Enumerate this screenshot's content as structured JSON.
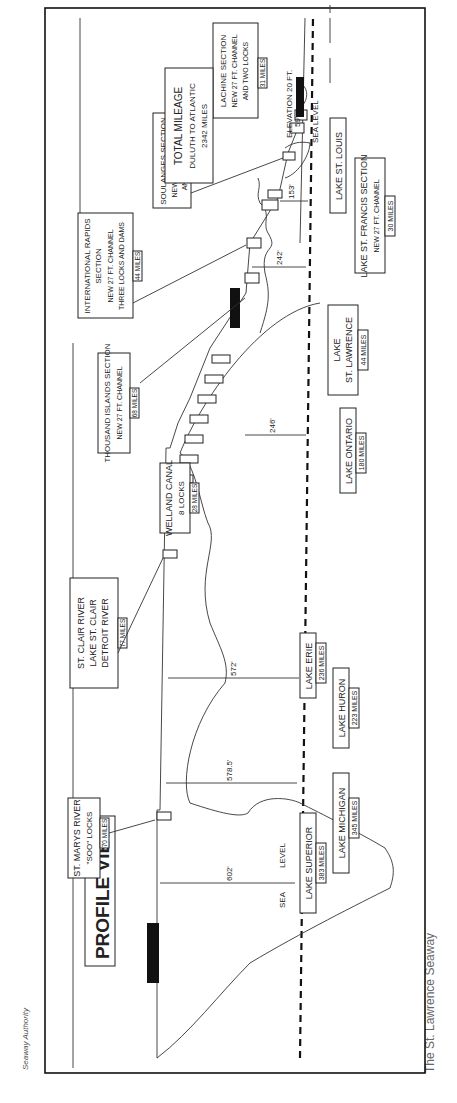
{
  "credit": "Seaway Authority",
  "caption": "The St. Lawrence Seaway",
  "title": "PROFILE VIEW",
  "sea_level_label_left": [
    "SEA",
    "LEVEL"
  ],
  "sea_level_label_right": "SEA LEVEL",
  "elevation_label": "ELEVATION 20 FT.",
  "total": {
    "line1": "TOTAL MILEAGE",
    "line2": "DULUTH TO ATLANTIC",
    "line3": "2342 MILES"
  },
  "heights": {
    "superior": "602'",
    "michigan_huron": "578.5'",
    "erie": "572'",
    "ontario": "246'",
    "st_lawrence": "242'",
    "st_francis": "153'",
    "st_louis": "59'"
  },
  "upper_labels": [
    {
      "line1": "ST. MARYS RIVER",
      "line2": "\"SOO\" LOCKS",
      "miles": "70 MILES"
    },
    {
      "line1": "ST. CLAIR RIVER",
      "line2": "LAKE ST. CLAIR",
      "line3": "DETROIT RIVER",
      "miles": "77 MILES"
    },
    {
      "line1": "WELLAND CANAL",
      "line2": "8 LOCKS",
      "miles": "28 MILES"
    },
    {
      "line1": "THOUSAND ISLANDS SECTION",
      "line2": "NEW 27 FT. CHANNEL",
      "miles": "68 MILES"
    },
    {
      "line1": "INTERNATIONAL RAPIDS",
      "line2": "SECTION",
      "line3": "NEW 27 FT. CHANNEL",
      "line4": "THREE LOCKS AND DAMS",
      "miles": "44 MILES"
    },
    {
      "line1": "SOULANGES SECTION",
      "line2": "NEW 27 FT. CHANNEL",
      "line3": "AND TWO LOCKS",
      "miles": "16 MILES"
    },
    {
      "line1": "LACHINE SECTION",
      "line2": "NEW 27 FT. CHANNEL",
      "line3": "AND TWO LOCKS",
      "miles": "31 MILES"
    }
  ],
  "lakes": [
    {
      "name": "LAKE SUPERIOR",
      "miles": "383 MILES"
    },
    {
      "name": "LAKE MICHIGAN",
      "miles": "345 MILES"
    },
    {
      "name": "LAKE HURON",
      "miles": "223 MILES"
    },
    {
      "name": "LAKE ERIE",
      "miles": "236 MILES"
    },
    {
      "name": "LAKE ONTARIO",
      "miles": "180 MILES"
    },
    {
      "name1": "LAKE",
      "name2": "ST. LAWRENCE",
      "miles": "44 MILES"
    },
    {
      "name": "LAKE ST. FRANCIS SECTION",
      "sub": "NEW 27 FT. CHANNEL",
      "miles": "30 MILES"
    },
    {
      "name": "LAKE ST. LOUIS"
    },
    {
      "name": "TIDE WATER SECTION",
      "sub": "DEEP WATER",
      "sub2": "FROM MONTREAL TO SEA",
      "miles": "1000 MILES"
    }
  ]
}
